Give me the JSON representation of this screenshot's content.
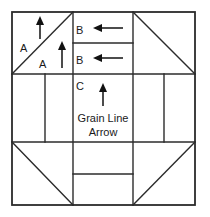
{
  "diagram": {
    "type": "quilt-block-diagram",
    "canvas": {
      "width": 210,
      "height": 217,
      "background": "#ffffff"
    },
    "line_color": "#2b2b2b",
    "text_color": "#1a1a1a",
    "block_frame": {
      "left": 12,
      "top": 12,
      "right": 195,
      "bottom": 205
    },
    "grid": {
      "vertical_lines": [
        73,
        133
      ],
      "horizontal_lines": [
        74,
        142
      ],
      "sub_dividers": {
        "left_middle_vertical": 45,
        "right_middle_vertical": 164,
        "top_center_horizontal": 43,
        "bottom_center_horizontal": 174
      }
    },
    "labels": {
      "a_upper": "A",
      "a_lower": "A",
      "b_upper": "B",
      "b_lower": "B",
      "c_center": "C",
      "grain_line_1": "Grain Line",
      "grain_line_2": "Arrow"
    },
    "cells": [
      {
        "name": "top-left-triangle-pair",
        "pieces": "A",
        "has_diagonal": true,
        "diagonal": "bottom-left-to-top-right"
      },
      {
        "name": "top-center-strips",
        "pieces": "B",
        "has_diagonal": false,
        "strips": 2
      },
      {
        "name": "top-right-triangle-pair",
        "pieces": "",
        "has_diagonal": true,
        "diagonal": "top-left-to-bottom-right"
      },
      {
        "name": "middle-left-strips",
        "pieces": "",
        "has_diagonal": false,
        "strips": 2
      },
      {
        "name": "center-square",
        "pieces": "C",
        "has_diagonal": false,
        "strips": 1
      },
      {
        "name": "middle-right-strips",
        "pieces": "",
        "has_diagonal": false,
        "strips": 2
      },
      {
        "name": "bottom-left-triangle-pair",
        "pieces": "",
        "has_diagonal": true,
        "diagonal": "top-left-to-bottom-right"
      },
      {
        "name": "bottom-center-strips",
        "pieces": "",
        "has_diagonal": false,
        "strips": 2
      },
      {
        "name": "bottom-right-triangle-pair",
        "pieces": "",
        "has_diagonal": true,
        "diagonal": "bottom-left-to-top-right"
      }
    ],
    "arrows": [
      {
        "name": "grain-arrow-a-upper",
        "direction": "up",
        "x": 40,
        "y_from": 38,
        "y_to": 20
      },
      {
        "name": "grain-arrow-a-lower",
        "direction": "up",
        "x": 62,
        "y_from": 68,
        "y_to": 46
      },
      {
        "name": "grain-arrow-b-upper",
        "direction": "left",
        "y": 28,
        "x_from": 122,
        "x_to": 94
      },
      {
        "name": "grain-arrow-b-lower",
        "direction": "left",
        "y": 58,
        "x_from": 122,
        "x_to": 94
      },
      {
        "name": "grain-arrow-c-center",
        "direction": "up",
        "x": 103,
        "y_from": 105,
        "y_to": 86
      }
    ]
  }
}
